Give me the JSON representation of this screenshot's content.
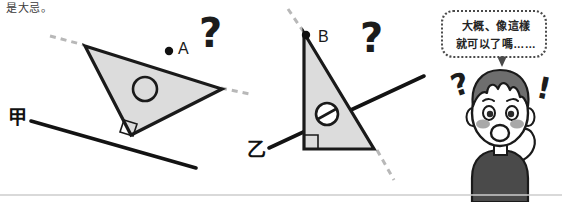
{
  "page": {
    "caption_text": "是大忌。",
    "background_color": "#ffffff",
    "divider_color": "#cccccc"
  },
  "figure": {
    "type": "geometry-illustration",
    "shape_fill": "#dcdcdc",
    "stroke_color": "#1a1a1a",
    "dash_color": "#b5b5b5",
    "left_diagram": {
      "name": "tilted-triangle-on-line-jia",
      "line_label": "甲",
      "vertex_label": "A",
      "center_mark": "circle-outline",
      "right_angle_mark": true,
      "question_mark": "?"
    },
    "right_diagram": {
      "name": "upright-triangle-on-line-yi",
      "line_label": "乙",
      "vertex_label": "B",
      "center_mark": "circle-with-slash",
      "right_angle_mark": true,
      "question_mark": "?"
    }
  },
  "speech": {
    "line1": "大概、像這樣",
    "line2": "就可以了嗎……",
    "border_color": "#4a4a4a"
  },
  "character": {
    "name": "confused-boy",
    "hair_color": "#6e6e6e",
    "skin_color": "#ffffff",
    "shirt_color": "#4a4a4a",
    "blush_color": "#9a9a9a",
    "expressions": [
      "question-mark-float",
      "exclamation-mark-float"
    ]
  }
}
